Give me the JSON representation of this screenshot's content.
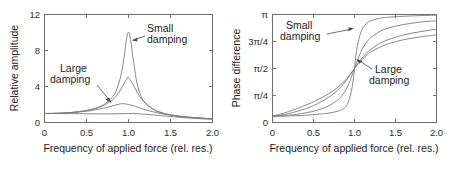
{
  "figure": {
    "name": "resonance-amplitude-and-phase",
    "panels": [
      "amplitude",
      "phase"
    ]
  },
  "chart_data": [
    {
      "type": "line",
      "id": "amplitude",
      "title": "",
      "xlabel": "Frequency of applied force (rel. res.)",
      "ylabel": "Relative amplitude",
      "xlim": [
        0,
        2.0
      ],
      "ylim": [
        0,
        12
      ],
      "xticks": [
        0,
        0.5,
        1.0,
        1.5,
        2.0
      ],
      "xticklabels": [
        "0",
        "0.5",
        "1.0",
        "1.5",
        "2.0"
      ],
      "yticks": [
        0,
        4,
        8,
        12
      ],
      "yticklabels": [
        "0",
        "4",
        "8",
        "12"
      ],
      "grid": false,
      "legend": "none",
      "annotations": [
        {
          "text_line1": "Small",
          "text_line2": "damping",
          "points_to": [
            1.0,
            10.0
          ]
        },
        {
          "text_line1": "Large",
          "text_line2": "damping",
          "points_to": [
            0.85,
            1.85
          ]
        }
      ],
      "series": [
        {
          "name": "gamma-0.1 (small damping)",
          "damping": 0.1,
          "peak_x": 1.0,
          "peak_y": 10.0,
          "x": [
            0,
            0.1,
            0.2,
            0.3,
            0.4,
            0.5,
            0.6,
            0.7,
            0.8,
            0.85,
            0.9,
            0.93,
            0.95,
            0.97,
            0.99,
            1.0,
            1.01,
            1.03,
            1.05,
            1.07,
            1.1,
            1.15,
            1.2,
            1.3,
            1.4,
            1.5,
            1.6,
            1.7,
            1.8,
            1.9,
            2.0
          ],
          "y": [
            1.0,
            1.01,
            1.04,
            1.1,
            1.19,
            1.33,
            1.56,
            1.95,
            2.74,
            3.46,
            4.86,
            6.2,
            7.4,
            8.9,
            9.9,
            10.0,
            9.9,
            8.9,
            7.4,
            6.2,
            4.4,
            2.9,
            2.17,
            1.42,
            1.07,
            0.85,
            0.7,
            0.6,
            0.52,
            0.46,
            0.41
          ]
        },
        {
          "name": "gamma-0.2",
          "damping": 0.2,
          "peak_x": 0.99,
          "peak_y": 5.0,
          "x": [
            0,
            0.1,
            0.2,
            0.3,
            0.4,
            0.5,
            0.6,
            0.7,
            0.8,
            0.85,
            0.9,
            0.95,
            0.99,
            1.0,
            1.05,
            1.1,
            1.15,
            1.2,
            1.3,
            1.4,
            1.5,
            1.6,
            1.7,
            1.8,
            1.9,
            2.0
          ],
          "y": [
            1.0,
            1.01,
            1.04,
            1.1,
            1.19,
            1.33,
            1.54,
            1.87,
            2.43,
            2.88,
            3.55,
            4.4,
            5.0,
            4.98,
            4.3,
            3.4,
            2.68,
            2.15,
            1.45,
            1.07,
            0.85,
            0.7,
            0.6,
            0.52,
            0.46,
            0.41
          ]
        },
        {
          "name": "gamma-0.5",
          "damping": 0.5,
          "peak_x": 0.93,
          "peak_y": 2.1,
          "x": [
            0,
            0.1,
            0.2,
            0.3,
            0.4,
            0.5,
            0.6,
            0.7,
            0.8,
            0.85,
            0.9,
            0.93,
            1.0,
            1.05,
            1.1,
            1.2,
            1.3,
            1.4,
            1.5,
            1.6,
            1.7,
            1.8,
            1.9,
            2.0
          ],
          "y": [
            1.0,
            1.01,
            1.03,
            1.08,
            1.15,
            1.25,
            1.4,
            1.58,
            1.82,
            1.95,
            2.06,
            2.1,
            2.0,
            1.88,
            1.73,
            1.42,
            1.17,
            0.97,
            0.82,
            0.7,
            0.6,
            0.52,
            0.46,
            0.41
          ]
        },
        {
          "name": "gamma-1.0 (large damping)",
          "damping": 1.0,
          "peak_x": 0.0,
          "peak_y": 1.0,
          "x": [
            0,
            0.1,
            0.2,
            0.3,
            0.4,
            0.5,
            0.6,
            0.7,
            0.8,
            0.9,
            1.0,
            1.1,
            1.2,
            1.3,
            1.4,
            1.5,
            1.6,
            1.7,
            1.8,
            1.9,
            2.0
          ],
          "y": [
            1.0,
            1.0,
            0.99,
            0.99,
            0.98,
            0.97,
            0.96,
            0.96,
            0.96,
            0.98,
            1.0,
            0.98,
            0.92,
            0.84,
            0.75,
            0.66,
            0.58,
            0.51,
            0.45,
            0.4,
            0.36
          ]
        }
      ]
    },
    {
      "type": "line",
      "id": "phase",
      "title": "",
      "xlabel": "Frequency of applied force (rel. res.)",
      "ylabel": "Phase difference",
      "xlim": [
        0,
        2.0
      ],
      "ylim": [
        0,
        3.14159
      ],
      "xticks": [
        0,
        0.5,
        1.0,
        1.5,
        2.0
      ],
      "xticklabels": [
        "0",
        "0.5",
        "1.0",
        "1.5",
        "2.0"
      ],
      "yticks": [
        0,
        0.785398,
        1.570796,
        2.356194,
        3.14159
      ],
      "yticklabels": [
        "0",
        "π/4",
        "π/2",
        "3π/4",
        "π"
      ],
      "grid": false,
      "legend": "none",
      "annotations": [
        {
          "text_line1": "Small",
          "text_line2": "damping",
          "points_to": [
            1.02,
            3.0
          ]
        },
        {
          "text_line1": "Large",
          "text_line2": "damping",
          "points_to": [
            1.0,
            1.571
          ]
        }
      ],
      "series": [
        {
          "name": "gamma-0.05 (small damping)",
          "damping": 0.05,
          "x": [
            0,
            0.2,
            0.4,
            0.6,
            0.7,
            0.8,
            0.85,
            0.9,
            0.94,
            0.97,
            0.99,
            1.0,
            1.01,
            1.03,
            1.06,
            1.1,
            1.15,
            1.2,
            1.3,
            1.4,
            1.6,
            1.8,
            2.0
          ],
          "y": [
            0.18,
            0.19,
            0.21,
            0.25,
            0.28,
            0.33,
            0.38,
            0.48,
            0.7,
            1.02,
            1.34,
            1.571,
            1.8,
            2.15,
            2.49,
            2.74,
            2.89,
            2.96,
            3.03,
            3.06,
            3.09,
            3.11,
            3.12
          ]
        },
        {
          "name": "gamma-0.15",
          "damping": 0.15,
          "x": [
            0,
            0.2,
            0.4,
            0.5,
            0.6,
            0.7,
            0.8,
            0.85,
            0.9,
            0.95,
            1.0,
            1.05,
            1.1,
            1.15,
            1.2,
            1.3,
            1.4,
            1.5,
            1.6,
            1.8,
            2.0
          ],
          "y": [
            0.18,
            0.21,
            0.28,
            0.33,
            0.4,
            0.5,
            0.66,
            0.79,
            0.97,
            1.24,
            1.571,
            1.9,
            2.16,
            2.34,
            2.47,
            2.64,
            2.74,
            2.8,
            2.85,
            2.92,
            2.96
          ]
        },
        {
          "name": "gamma-0.35",
          "damping": 0.35,
          "x": [
            0,
            0.2,
            0.4,
            0.5,
            0.6,
            0.7,
            0.8,
            0.9,
            1.0,
            1.1,
            1.2,
            1.3,
            1.4,
            1.5,
            1.6,
            1.7,
            1.8,
            1.9,
            2.0
          ],
          "y": [
            0.18,
            0.26,
            0.4,
            0.49,
            0.61,
            0.76,
            0.95,
            1.22,
            1.571,
            1.9,
            2.13,
            2.29,
            2.4,
            2.48,
            2.55,
            2.6,
            2.64,
            2.68,
            2.71
          ]
        },
        {
          "name": "gamma-0.7 (large damping)",
          "damping": 0.7,
          "x": [
            0,
            0.2,
            0.4,
            0.5,
            0.6,
            0.7,
            0.8,
            0.9,
            1.0,
            1.1,
            1.2,
            1.3,
            1.4,
            1.5,
            1.6,
            1.7,
            1.8,
            1.9,
            2.0
          ],
          "y": [
            0.18,
            0.32,
            0.5,
            0.6,
            0.72,
            0.86,
            1.03,
            1.26,
            1.571,
            1.85,
            2.05,
            2.18,
            2.28,
            2.35,
            2.41,
            2.45,
            2.49,
            2.52,
            2.55
          ]
        }
      ]
    }
  ],
  "left_panel": {
    "ylabel": "Relative amplitude",
    "xlabel": "Frequency of applied force (rel. res.)",
    "yticklabels": [
      "12",
      "8",
      "4",
      "0"
    ],
    "xticklabels": [
      "0",
      "0.5",
      "1.0",
      "1.5",
      "2.0"
    ],
    "annotation_small": {
      "line1": "Small",
      "line2": "damping"
    },
    "annotation_large": {
      "line1": "Large",
      "line2": "damping"
    }
  },
  "right_panel": {
    "ylabel": "Phase difference",
    "xlabel": "Frequency of applied force (rel. res.)",
    "yticklabels": [
      "π",
      "3π/4",
      "π/2",
      "π/4",
      "0"
    ],
    "xticklabels": [
      "0",
      "0.5",
      "1.0",
      "1.5",
      "2.0"
    ],
    "annotation_small": {
      "line1": "Small",
      "line2": "damping"
    },
    "annotation_large": {
      "line1": "Large",
      "line2": "damping"
    }
  },
  "colors": {
    "curve": "#7a7a7a",
    "axis": "#6e6e6e",
    "text": "#1c1c1c",
    "annotation": "#4a4a4a",
    "background": "#ffffff"
  }
}
